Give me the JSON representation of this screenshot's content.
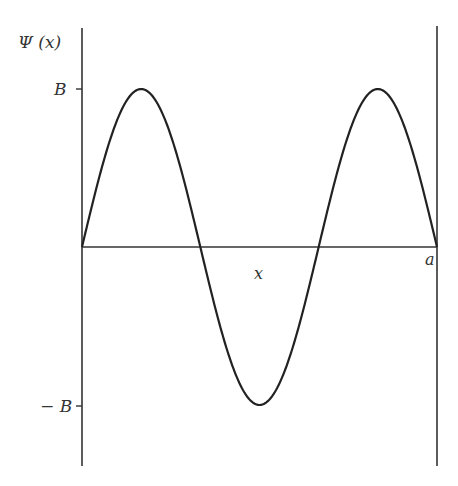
{
  "figure": {
    "y_axis_label": "Ψ (x)",
    "x_axis_label": "x",
    "right_boundary_label": "a",
    "y_tick_positive": "B",
    "y_tick_negative": "− B",
    "curve": "Ψ(x) = B sin(3πx/a), 0 ≤ x ≤ a",
    "colors": {
      "line": "#333333",
      "background": "#ffffff"
    }
  },
  "chart_data": {
    "type": "line",
    "title": "",
    "xlabel": "x",
    "ylabel": "Ψ(x)",
    "x": [
      0,
      0.1667,
      0.3333,
      0.5,
      0.6667,
      0.8333,
      1.0
    ],
    "series": [
      {
        "name": "Ψ(x)",
        "values": [
          0,
          1,
          0,
          -1,
          0,
          1,
          0
        ]
      }
    ],
    "xlim": [
      0,
      "a"
    ],
    "ylim": [
      "-B",
      "B"
    ],
    "grid": false
  }
}
